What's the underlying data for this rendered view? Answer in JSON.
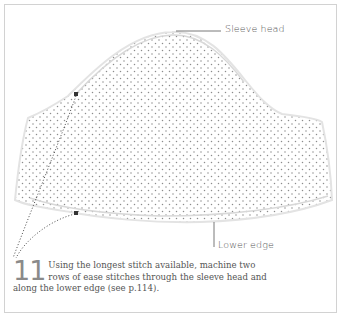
{
  "figure": {
    "labels": {
      "sleeve_head": "Sleeve head",
      "lower_edge": "Lower edge"
    },
    "step": {
      "number": "11",
      "text": "Using the longest stitch available, machine two rows of ease stitches through the sleeve head and along the lower edge (see p.114)."
    },
    "colors": {
      "border": "#d2d2d2",
      "fabric_dots": "#8c8c8c",
      "text": "#555555",
      "step_number": "#8a8a8a"
    }
  }
}
